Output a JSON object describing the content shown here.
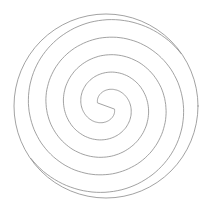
{
  "diagram": {
    "type": "double-spiral-in-circle",
    "background": "#ffffff",
    "stroke_color": "#8a8a8a",
    "stroke_width": 0.8,
    "center": [
      106,
      106
    ],
    "outer_circle_radius": 92,
    "spiral": {
      "start_radius": 9,
      "growth_per_radian": 5.6,
      "turns": 2.35,
      "start_angle_deg": 200
    }
  }
}
